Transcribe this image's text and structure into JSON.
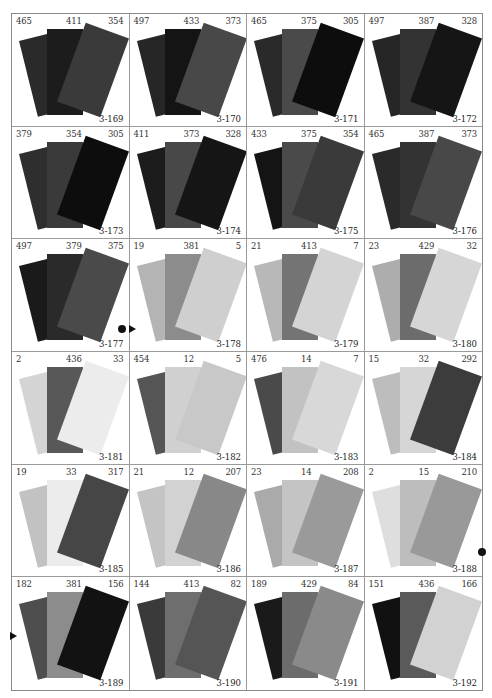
{
  "page": {
    "swatches": [
      {
        "code": "3-169",
        "labels": [
          "465",
          "411",
          "354"
        ],
        "colors": [
          "#2a2a2a",
          "#1c1c1c",
          "#3a3a3a"
        ]
      },
      {
        "code": "3-170",
        "labels": [
          "497",
          "433",
          "373"
        ],
        "colors": [
          "#262626",
          "#141414",
          "#484848"
        ]
      },
      {
        "code": "3-171",
        "labels": [
          "465",
          "375",
          "305"
        ],
        "colors": [
          "#2a2a2a",
          "#4a4a4a",
          "#0d0d0d"
        ]
      },
      {
        "code": "3-172",
        "labels": [
          "497",
          "387",
          "328"
        ],
        "colors": [
          "#262626",
          "#333333",
          "#151515"
        ]
      },
      {
        "code": "3-173",
        "labels": [
          "379",
          "354",
          "305"
        ],
        "colors": [
          "#2e2e2e",
          "#3a3a3a",
          "#0d0d0d"
        ]
      },
      {
        "code": "3-174",
        "labels": [
          "411",
          "373",
          "328"
        ],
        "colors": [
          "#1c1c1c",
          "#484848",
          "#151515"
        ]
      },
      {
        "code": "3-175",
        "labels": [
          "433",
          "375",
          "354"
        ],
        "colors": [
          "#141414",
          "#4a4a4a",
          "#3a3a3a"
        ]
      },
      {
        "code": "3-176",
        "labels": [
          "465",
          "387",
          "373"
        ],
        "colors": [
          "#2a2a2a",
          "#333333",
          "#484848"
        ]
      },
      {
        "code": "3-177",
        "labels": [
          "497",
          "379",
          "375"
        ],
        "colors": [
          "#1a1a1a",
          "#2a2a2a",
          "#4a4a4a"
        ]
      },
      {
        "code": "3-178",
        "labels": [
          "19",
          "381",
          "5"
        ],
        "colors": [
          "#b4b4b4",
          "#8c8c8c",
          "#cfcfcf"
        ]
      },
      {
        "code": "3-179",
        "labels": [
          "21",
          "413",
          "7"
        ],
        "colors": [
          "#b8b8b8",
          "#747474",
          "#d4d4d4"
        ]
      },
      {
        "code": "3-180",
        "labels": [
          "23",
          "429",
          "32"
        ],
        "colors": [
          "#adadad",
          "#6c6c6c",
          "#d6d6d6"
        ]
      },
      {
        "code": "3-181",
        "labels": [
          "2",
          "436",
          "33"
        ],
        "colors": [
          "#d4d4d4",
          "#585858",
          "#ececec"
        ]
      },
      {
        "code": "3-182",
        "labels": [
          "454",
          "12",
          "5"
        ],
        "colors": [
          "#555555",
          "#d0d0d0",
          "#c8c8c8"
        ]
      },
      {
        "code": "3-183",
        "labels": [
          "476",
          "14",
          "7"
        ],
        "colors": [
          "#4a4a4a",
          "#c2c2c2",
          "#d8d8d8"
        ]
      },
      {
        "code": "3-184",
        "labels": [
          "15",
          "32",
          "292"
        ],
        "colors": [
          "#bdbdbd",
          "#d6d6d6",
          "#3c3c3c"
        ]
      },
      {
        "code": "3-185",
        "labels": [
          "19",
          "33",
          "317"
        ],
        "colors": [
          "#c2c2c2",
          "#ececec",
          "#464646"
        ]
      },
      {
        "code": "3-186",
        "labels": [
          "21",
          "12",
          "207"
        ],
        "colors": [
          "#c4c4c4",
          "#d2d2d2",
          "#888888"
        ]
      },
      {
        "code": "3-187",
        "labels": [
          "23",
          "14",
          "208"
        ],
        "colors": [
          "#aaaaaa",
          "#c4c4c4",
          "#9a9a9a"
        ]
      },
      {
        "code": "3-188",
        "labels": [
          "2",
          "15",
          "210"
        ],
        "colors": [
          "#dedede",
          "#bdbdbd",
          "#999999"
        ]
      },
      {
        "code": "3-189",
        "labels": [
          "182",
          "381",
          "156"
        ],
        "colors": [
          "#4e4e4e",
          "#8c8c8c",
          "#121212"
        ]
      },
      {
        "code": "3-190",
        "labels": [
          "144",
          "413",
          "82"
        ],
        "colors": [
          "#3a3a3a",
          "#6e6e6e",
          "#555555"
        ]
      },
      {
        "code": "3-191",
        "labels": [
          "189",
          "429",
          "84"
        ],
        "colors": [
          "#1a1a1a",
          "#6c6c6c",
          "#8a8a8a"
        ]
      },
      {
        "code": "3-192",
        "labels": [
          "151",
          "436",
          "166"
        ],
        "colors": [
          "#111111",
          "#5a5a5a",
          "#d2d2d2"
        ]
      }
    ],
    "markers": [
      {
        "type": "dot",
        "left": 118,
        "top": 325
      },
      {
        "type": "triangle",
        "left": 129,
        "top": 325
      },
      {
        "type": "dot",
        "left": 478,
        "top": 548
      },
      {
        "type": "triangle",
        "left": 10,
        "top": 632
      }
    ]
  }
}
